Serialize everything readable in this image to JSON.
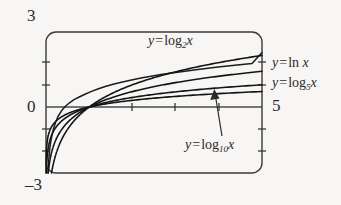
{
  "figure": {
    "name": "logarithm-functions-graph",
    "background_color": "#f7f6f4",
    "ink_color": "#2b2b2b"
  },
  "axis_labels": {
    "y_max": "3",
    "y_min": "–3",
    "origin": "0",
    "x_max": "5"
  },
  "curve_labels": {
    "log2": {
      "lhs": "y",
      "eq": "=",
      "fn": "log",
      "base": "2",
      "arg": "x"
    },
    "ln": {
      "lhs": "y",
      "eq": "=",
      "fn": "ln",
      "base": "",
      "arg": "x"
    },
    "log5": {
      "lhs": "y",
      "eq": "=",
      "fn": "log",
      "base": "5",
      "arg": "x"
    },
    "log10": {
      "lhs": "y",
      "eq": "=",
      "fn": "log",
      "base": "10",
      "arg": "x"
    }
  },
  "chart_data": {
    "type": "line",
    "title": "",
    "xlabel": "",
    "ylabel": "",
    "xlim": [
      0,
      5
    ],
    "ylim": [
      -3,
      3
    ],
    "grid": false,
    "legend": "inline-annotations",
    "x_ticks": [
      1,
      2,
      3,
      4,
      5
    ],
    "y_ticks": [
      -3,
      -2,
      -1,
      0,
      1,
      2,
      3
    ],
    "x_tick_labels": [
      "",
      "",
      "",
      "",
      "5"
    ],
    "y_tick_labels": [
      "–3",
      "",
      "",
      "0",
      "",
      "",
      "3"
    ],
    "series": [
      {
        "name": "y = log2 x",
        "base": 2,
        "x": [
          0.04,
          0.06,
          0.09,
          0.125,
          0.18,
          0.25,
          0.35,
          0.5,
          0.7,
          1.0,
          1.4,
          2.0,
          2.5,
          3.0,
          3.5,
          4.0,
          4.5,
          5.0
        ],
        "y": [
          -4.64,
          -4.06,
          -3.47,
          -3.0,
          -2.47,
          -2.0,
          -1.51,
          -1.0,
          -0.51,
          0.0,
          0.49,
          1.0,
          1.32,
          1.58,
          1.81,
          2.0,
          2.17,
          2.32
        ]
      },
      {
        "name": "y = ln x",
        "base": 2.71828,
        "x": [
          0.04,
          0.06,
          0.09,
          0.125,
          0.18,
          0.25,
          0.35,
          0.5,
          0.7,
          1.0,
          1.4,
          2.0,
          2.5,
          3.0,
          3.5,
          4.0,
          4.5,
          5.0
        ],
        "y": [
          -3.22,
          -2.81,
          -2.41,
          -2.08,
          -1.71,
          -1.39,
          -1.05,
          -0.69,
          -0.36,
          0.0,
          0.34,
          0.69,
          0.92,
          1.1,
          1.25,
          1.39,
          1.5,
          1.61
        ]
      },
      {
        "name": "y = log5 x",
        "base": 5,
        "x": [
          0.04,
          0.06,
          0.09,
          0.125,
          0.18,
          0.25,
          0.35,
          0.5,
          0.7,
          1.0,
          1.4,
          2.0,
          2.5,
          3.0,
          3.5,
          4.0,
          4.5,
          5.0
        ],
        "y": [
          -2.0,
          -1.75,
          -1.5,
          -1.29,
          -1.07,
          -0.86,
          -0.65,
          -0.43,
          -0.22,
          0.0,
          0.21,
          0.43,
          0.57,
          0.68,
          0.78,
          0.86,
          0.93,
          1.0
        ]
      },
      {
        "name": "y = log10 x",
        "base": 10,
        "x": [
          0.04,
          0.06,
          0.09,
          0.125,
          0.18,
          0.25,
          0.35,
          0.5,
          0.7,
          1.0,
          1.4,
          2.0,
          2.5,
          3.0,
          3.5,
          4.0,
          4.5,
          5.0
        ],
        "y": [
          -1.4,
          -1.22,
          -1.05,
          -0.9,
          -0.74,
          -0.6,
          -0.46,
          -0.3,
          -0.15,
          0.0,
          0.15,
          0.3,
          0.4,
          0.48,
          0.54,
          0.6,
          0.65,
          0.7
        ]
      }
    ],
    "annotations": [
      {
        "text": "y = log2 x",
        "target_series": "y = log2 x"
      },
      {
        "text": "y = ln x",
        "target_series": "y = ln x"
      },
      {
        "text": "y = log5 x",
        "target_series": "y = log5 x"
      },
      {
        "text": "y = log10 x",
        "target_series": "y = log10 x",
        "arrow": true
      }
    ]
  },
  "geometry": {
    "frame": {
      "x": 46,
      "y": 32,
      "width": 216,
      "height": 141,
      "corner_radius": 10
    },
    "x_axis_y": 107,
    "x_unit_px": 43.2,
    "y_unit_px": 22.2,
    "x_origin_px": 46,
    "arrow": {
      "from_x": 222,
      "from_y": 136,
      "to_x": 214,
      "to_y": 92
    }
  }
}
